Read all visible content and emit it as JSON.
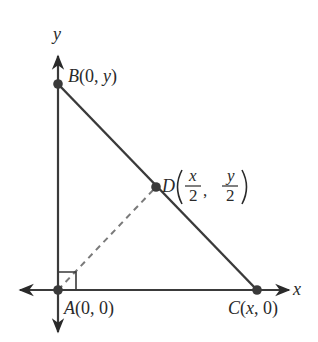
{
  "diagram": {
    "colors": {
      "line": "#3a3a3a",
      "point": "#3a3a3a",
      "dashed": "#7a7a7a",
      "text": "#2a2a2a"
    },
    "axes": {
      "x_label": "x",
      "y_label": "y"
    },
    "points": {
      "A": {
        "name": "A",
        "coords": "(0, 0)"
      },
      "B": {
        "name": "B",
        "coords_prefix": "(0, ",
        "coords_var": "y",
        "coords_suffix": ")"
      },
      "C": {
        "name": "C",
        "coords_prefix": "(",
        "coords_var": "x",
        "coords_suffix": ", 0)"
      },
      "D": {
        "name": "D",
        "x_num": "x",
        "x_den": "2",
        "y_num": "y",
        "y_den": "2",
        "separator": ","
      }
    },
    "segments": [
      {
        "from": "A",
        "to": "B",
        "style": "solid"
      },
      {
        "from": "A",
        "to": "C",
        "style": "solid"
      },
      {
        "from": "B",
        "to": "C",
        "style": "solid"
      },
      {
        "from": "A",
        "to": "D",
        "style": "dashed"
      }
    ],
    "right_angle_marker": "A"
  }
}
